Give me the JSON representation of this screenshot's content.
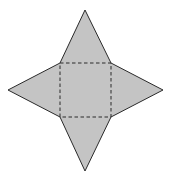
{
  "diagram": {
    "colors": {
      "fill": "#c4c4c4",
      "stroke": "#2a2a2a",
      "fold": "#2a2a2a",
      "background": "#ffffff"
    },
    "square": {
      "x1": 60,
      "y1": 63,
      "x2": 111,
      "y2": 117
    },
    "apexes": {
      "top": [
        85,
        10
      ],
      "right": [
        163,
        90
      ],
      "bottom": [
        85,
        171
      ],
      "left": [
        8,
        90
      ]
    },
    "fold_style": "dashed"
  }
}
